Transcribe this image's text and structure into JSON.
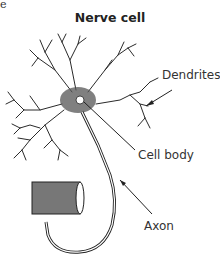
{
  "corner_fragment": "e",
  "title": "Nerve cell",
  "labels": {
    "dendrites": "Dendrites",
    "cell_body": "Cell body",
    "axon": "Axon"
  },
  "colors": {
    "ink": "#222222",
    "background": "#ffffff"
  }
}
